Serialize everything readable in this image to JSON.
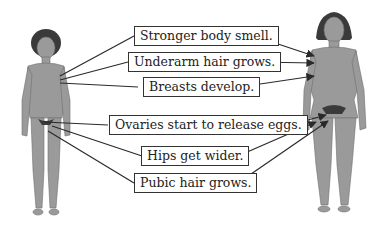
{
  "diagram": {
    "figures": [
      {
        "name": "girl",
        "description": "Child figure before puberty"
      },
      {
        "name": "woman",
        "description": "Adult female figure after puberty"
      }
    ],
    "labels": [
      {
        "id": "smell",
        "text": "Stronger body smell."
      },
      {
        "id": "underarm",
        "text": "Underarm hair grows."
      },
      {
        "id": "breasts",
        "text": "Breasts develop."
      },
      {
        "id": "ovaries",
        "text": "Ovaries start to release eggs."
      },
      {
        "id": "hips",
        "text": "Hips get wider."
      },
      {
        "id": "pubic",
        "text": "Pubic hair grows."
      }
    ],
    "colors": {
      "skin": "#9a9a9a",
      "hair": "#3a3a3a",
      "line": "#2a2a2a",
      "box_border": "#333333"
    }
  }
}
